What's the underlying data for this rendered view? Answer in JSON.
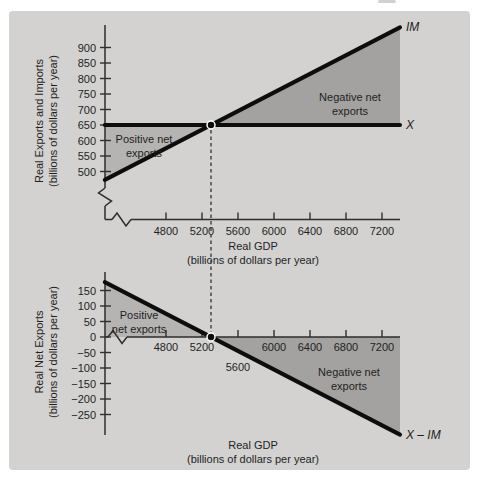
{
  "figure": {
    "page_bg": "#ffffff",
    "card_bg": "#d3d2d0"
  },
  "colors": {
    "positive_region": "#b5b4b2",
    "negative_region": "#a3a2a0",
    "curve": "#0d0d0d",
    "axis": "#2e2e2e",
    "text": "#1f1f1f",
    "dashed": "#3d3d3d",
    "dot_fill": "#0d0d0d",
    "dot_ring": "#ffffff"
  },
  "chart_data": [
    {
      "id": "exports-imports",
      "type": "line",
      "y_axis": {
        "label_lines": [
          "Real Exports and Imports",
          "(billions of dollars per year)"
        ],
        "ticks": [
          900,
          850,
          800,
          750,
          700,
          650,
          600,
          550,
          500
        ],
        "has_break": true
      },
      "x_axis": {
        "label_lines": [
          "Real GDP",
          "(billions of dollars per year)"
        ],
        "ticks": [
          4800,
          5200,
          5600,
          6000,
          6400,
          6800,
          7200
        ],
        "has_break": true
      },
      "series": [
        {
          "name": "IM",
          "label": "IM",
          "points": [
            [
              4120,
              473
            ],
            [
              7400,
              965
            ]
          ]
        },
        {
          "name": "X",
          "label": "X",
          "points": [
            [
              4120,
              650
            ],
            [
              7400,
              650
            ]
          ]
        }
      ],
      "equilibrium": {
        "gdp": 5300,
        "value": 650
      },
      "regions": [
        {
          "name": "positive-net-exports",
          "label_lines": [
            "Positive net",
            "exports"
          ],
          "polygon": [
            [
              4120,
              650
            ],
            [
              5300,
              650
            ],
            [
              4120,
              473
            ]
          ],
          "color_key": "positive_region"
        },
        {
          "name": "negative-net-exports",
          "label_lines": [
            "Negative net",
            "exports"
          ],
          "polygon": [
            [
              5300,
              650
            ],
            [
              7400,
              965
            ],
            [
              7400,
              650
            ]
          ],
          "color_key": "negative_region"
        }
      ]
    },
    {
      "id": "net-exports",
      "type": "line",
      "y_axis": {
        "label_lines": [
          "Real Net Exports",
          "(billions of dollars per year)"
        ],
        "ticks": [
          150,
          100,
          50,
          0,
          -50,
          -100,
          -150,
          -200,
          -250
        ],
        "has_break": false
      },
      "x_axis": {
        "label_lines": [
          "Real GDP",
          "(billions of dollars per year)"
        ],
        "ticks": [
          4800,
          5200,
          5600,
          6000,
          6400,
          6800,
          7200
        ],
        "offset_tick_label": 5600,
        "has_break": true
      },
      "series": [
        {
          "name": "X-IM",
          "label": "X – IM",
          "points": [
            [
              4120,
              177
            ],
            [
              7400,
              -315
            ]
          ]
        }
      ],
      "equilibrium": {
        "gdp": 5300,
        "value": 0
      },
      "regions": [
        {
          "name": "positive-net-exports",
          "label_lines": [
            "Positive",
            "net exports"
          ],
          "polygon": [
            [
              4120,
              0
            ],
            [
              5300,
              0
            ],
            [
              4120,
              177
            ]
          ],
          "color_key": "positive_region"
        },
        {
          "name": "negative-net-exports",
          "label_lines": [
            "Negative net",
            "exports"
          ],
          "polygon": [
            [
              5300,
              0
            ],
            [
              7400,
              0
            ],
            [
              7400,
              -315
            ]
          ],
          "color_key": "negative_region"
        }
      ]
    }
  ]
}
